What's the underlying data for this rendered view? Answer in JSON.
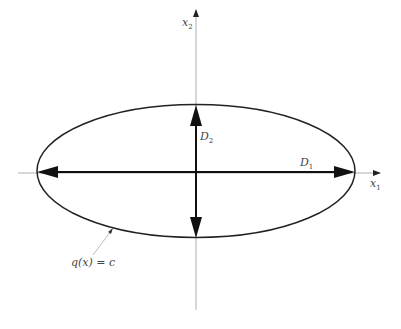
{
  "diagram": {
    "axes": {
      "x_label": "x",
      "x_sub": "1",
      "y_label": "x",
      "y_sub": "2"
    },
    "major_axis": {
      "label": "D",
      "sub": "1"
    },
    "minor_axis": {
      "label": "D",
      "sub": "2"
    },
    "curve_label": "q(x) = c",
    "colors": {
      "axis": "#999999",
      "ellipse": "#222222",
      "arrow": "#111111",
      "text": "#444444"
    }
  }
}
